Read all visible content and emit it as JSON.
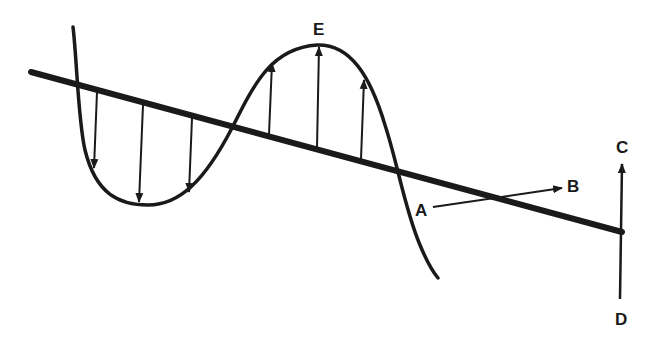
{
  "diagram": {
    "type": "transverse-wave-polarization",
    "stroke_color": "#1a1a1a",
    "background": "#ffffff",
    "labels": {
      "E": "E",
      "A": "A",
      "B": "B",
      "C": "C",
      "D": "D"
    },
    "elements": [
      {
        "id": "propagation-axis",
        "description": "thick diagonal line from upper-left to lower-right"
      },
      {
        "id": "wave",
        "description": "sinusoidal wave oscillating about the axis"
      },
      {
        "id": "field-vectors-down",
        "count": 3,
        "direction": "down"
      },
      {
        "id": "field-vectors-up",
        "count": 3,
        "direction": "up",
        "peak_label": "E"
      },
      {
        "id": "arrow-A-to-B",
        "from": "A",
        "to": "B"
      },
      {
        "id": "arrow-D-to-C",
        "from": "D",
        "to": "C"
      }
    ]
  }
}
